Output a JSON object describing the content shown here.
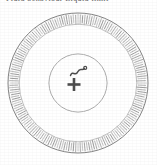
{
  "figure": {
    "caption_fragment": "clipped header text",
    "background_color": "#ffffff",
    "width": 157,
    "height": 165
  },
  "top_text": {
    "clipped_line": "Fluid behaviour   Liquid limit"
  },
  "diagram": {
    "type": "concentric-ring-diagram",
    "center": {
      "x": 78,
      "y": 83
    },
    "rings": [
      {
        "name": "outer-radial-tick-ring",
        "label": "outer radial hatch annulus",
        "outer_radius": 70,
        "inner_radius": 58,
        "fill": "#ffffff",
        "stroke": "#6e6e6e",
        "tick_count": 180,
        "texture": "radial-ticks"
      },
      {
        "name": "middle-crosshatch-ring",
        "label": "middle crosshatch annulus",
        "outer_radius": 58,
        "inner_radius": 29,
        "fill": "#e8e8e8",
        "stroke": "#8a8a8a",
        "texture": "grid-crosshatch"
      },
      {
        "name": "inner-core-circle",
        "label": "inner blank core",
        "outer_radius": 29,
        "inner_radius": 0,
        "fill": "#ffffff",
        "stroke": "#9a9a9a",
        "texture": "none"
      }
    ],
    "center_symbols": [
      {
        "name": "plus-symbol",
        "glyph": "+",
        "x": 74,
        "y": 84,
        "color": "#4a4a4a"
      },
      {
        "name": "squiggle-symbol",
        "glyph": "wave",
        "x": 80,
        "y": 71,
        "color": "#4a4a4a"
      }
    ],
    "colors": {
      "ink": "#5a5a5a",
      "ink_dark": "#3d3d3d",
      "hatch": "#9c9c9c",
      "grid": "#bdbdbd",
      "paper": "#ffffff"
    }
  }
}
